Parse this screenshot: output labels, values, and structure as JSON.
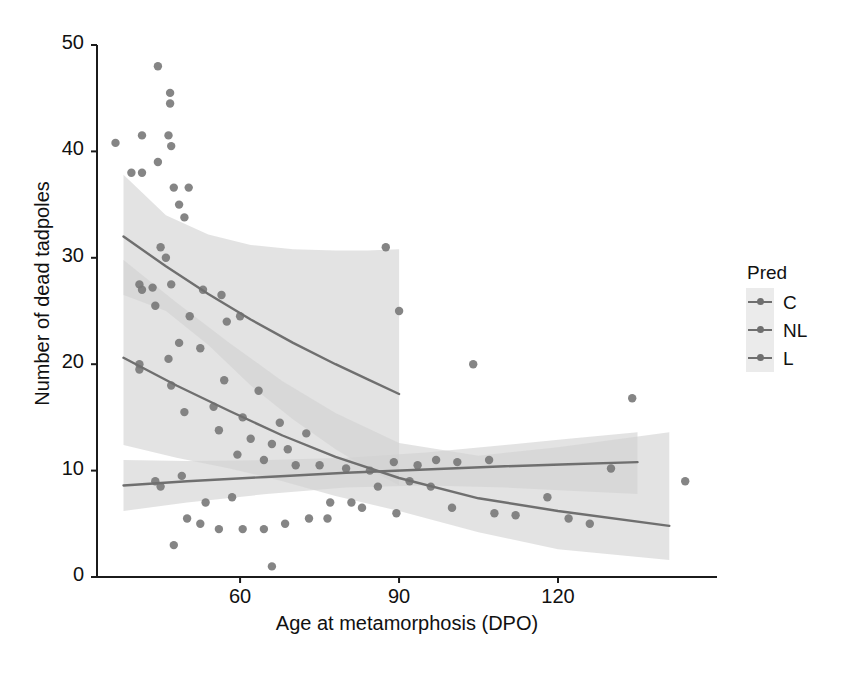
{
  "chart_data": {
    "type": "scatter",
    "title": "",
    "xlabel": "Age at metamorphosis (DPO)",
    "ylabel": "Number of dead tadpoles",
    "xlim": [
      33,
      150
    ],
    "ylim": [
      0,
      50
    ],
    "xticks": [
      60,
      90,
      120
    ],
    "yticks": [
      0,
      10,
      20,
      30,
      40,
      50
    ],
    "grid": false,
    "legend": {
      "title": "Pred",
      "position": "right",
      "entries": [
        "C",
        "NL",
        "L"
      ]
    },
    "point_color": "#787878",
    "line_color": "#6f6f6f",
    "band_color": "#d2d2d2",
    "points": [
      [
        36.5,
        40.8
      ],
      [
        44.5,
        48.0
      ],
      [
        46.8,
        45.5
      ],
      [
        46.8,
        44.5
      ],
      [
        41.5,
        41.5
      ],
      [
        46.5,
        41.5
      ],
      [
        47.0,
        40.5
      ],
      [
        44.5,
        39.0
      ],
      [
        41.5,
        38.0
      ],
      [
        47.5,
        36.6
      ],
      [
        50.3,
        36.6
      ],
      [
        48.5,
        35.0
      ],
      [
        49.5,
        33.8
      ],
      [
        39.5,
        38.0
      ],
      [
        45.0,
        31.0
      ],
      [
        46.0,
        30.0
      ],
      [
        87.5,
        31.0
      ],
      [
        41.0,
        27.5
      ],
      [
        41.5,
        27.0
      ],
      [
        43.5,
        27.2
      ],
      [
        47.0,
        27.5
      ],
      [
        53.0,
        27.0
      ],
      [
        56.5,
        26.5
      ],
      [
        44.0,
        25.5
      ],
      [
        50.5,
        24.5
      ],
      [
        57.5,
        24.0
      ],
      [
        60.0,
        24.5
      ],
      [
        48.5,
        22.0
      ],
      [
        52.5,
        21.5
      ],
      [
        46.5,
        20.5
      ],
      [
        41.0,
        20.0
      ],
      [
        41.0,
        19.5
      ],
      [
        47.0,
        18.0
      ],
      [
        57.0,
        18.5
      ],
      [
        63.5,
        17.5
      ],
      [
        55.0,
        16.0
      ],
      [
        49.5,
        15.5
      ],
      [
        60.5,
        15.0
      ],
      [
        67.5,
        14.5
      ],
      [
        72.5,
        13.5
      ],
      [
        56.0,
        13.8
      ],
      [
        62.0,
        13.0
      ],
      [
        66.0,
        12.5
      ],
      [
        69.0,
        12.0
      ],
      [
        59.5,
        11.5
      ],
      [
        64.5,
        11.0
      ],
      [
        70.5,
        10.5
      ],
      [
        75.0,
        10.5
      ],
      [
        80.0,
        10.2
      ],
      [
        84.5,
        10.0
      ],
      [
        89.0,
        10.8
      ],
      [
        93.5,
        10.5
      ],
      [
        97.0,
        11.0
      ],
      [
        101.0,
        10.8
      ],
      [
        104.0,
        20.0
      ],
      [
        90.0,
        25.0
      ],
      [
        134.0,
        16.8
      ],
      [
        144.0,
        9.0
      ],
      [
        130.0,
        10.2
      ],
      [
        118.0,
        7.5
      ],
      [
        122.0,
        5.5
      ],
      [
        126.0,
        5.0
      ],
      [
        112.0,
        5.8
      ],
      [
        108.0,
        6.0
      ],
      [
        100.0,
        6.5
      ],
      [
        96.0,
        8.5
      ],
      [
        92.0,
        9.0
      ],
      [
        86.0,
        8.5
      ],
      [
        81.0,
        7.0
      ],
      [
        77.0,
        7.0
      ],
      [
        73.0,
        5.5
      ],
      [
        68.5,
        5.0
      ],
      [
        64.5,
        4.5
      ],
      [
        60.5,
        4.5
      ],
      [
        56.0,
        4.5
      ],
      [
        52.5,
        5.0
      ],
      [
        50.0,
        5.5
      ],
      [
        53.5,
        7.0
      ],
      [
        58.5,
        7.5
      ],
      [
        66.0,
        1.0
      ],
      [
        47.5,
        3.0
      ],
      [
        45.0,
        8.5
      ],
      [
        49.0,
        9.5
      ],
      [
        44.0,
        9.0
      ],
      [
        76.5,
        5.5
      ],
      [
        83.0,
        6.5
      ],
      [
        89.5,
        6.0
      ],
      [
        107.0,
        11.0
      ]
    ],
    "series": [
      {
        "name": "C",
        "type": "fit-curve",
        "x_range": [
          38,
          90
        ],
        "fit": [
          [
            38,
            32.0
          ],
          [
            46,
            29.2
          ],
          [
            54,
            26.6
          ],
          [
            62,
            24.2
          ],
          [
            70,
            22.0
          ],
          [
            78,
            20.0
          ],
          [
            84,
            18.6
          ],
          [
            90,
            17.2
          ]
        ],
        "ci_upper": [
          [
            38,
            37.8
          ],
          [
            46,
            34.0
          ],
          [
            54,
            32.2
          ],
          [
            62,
            31.2
          ],
          [
            70,
            30.8
          ],
          [
            78,
            30.7
          ],
          [
            84,
            30.7
          ],
          [
            90,
            30.8
          ]
        ],
        "ci_lower": [
          [
            38,
            26.5
          ],
          [
            46,
            25.0
          ],
          [
            54,
            21.8
          ],
          [
            62,
            18.0
          ],
          [
            70,
            14.8
          ],
          [
            78,
            12.0
          ],
          [
            84,
            10.2
          ],
          [
            90,
            8.6
          ]
        ]
      },
      {
        "name": "NL",
        "type": "fit-curve",
        "x_range": [
          38,
          135
        ],
        "fit": [
          [
            38,
            8.6
          ],
          [
            50,
            9.0
          ],
          [
            65,
            9.4
          ],
          [
            80,
            9.8
          ],
          [
            95,
            10.1
          ],
          [
            110,
            10.4
          ],
          [
            122,
            10.6
          ],
          [
            135,
            10.8
          ]
        ],
        "ci_upper": [
          [
            38,
            11.0
          ],
          [
            50,
            10.9
          ],
          [
            65,
            11.0
          ],
          [
            80,
            11.2
          ],
          [
            95,
            11.7
          ],
          [
            110,
            12.4
          ],
          [
            122,
            13.0
          ],
          [
            135,
            13.6
          ]
        ],
        "ci_lower": [
          [
            38,
            6.2
          ],
          [
            50,
            7.0
          ],
          [
            65,
            7.8
          ],
          [
            80,
            8.4
          ],
          [
            95,
            8.6
          ],
          [
            110,
            8.4
          ],
          [
            122,
            8.1
          ],
          [
            135,
            7.8
          ]
        ]
      },
      {
        "name": "L",
        "type": "fit-curve",
        "x_range": [
          38,
          141
        ],
        "fit": [
          [
            38,
            20.6
          ],
          [
            48,
            18.0
          ],
          [
            58,
            15.6
          ],
          [
            68,
            13.3
          ],
          [
            78,
            11.3
          ],
          [
            90,
            9.3
          ],
          [
            105,
            7.4
          ],
          [
            120,
            6.2
          ],
          [
            141,
            4.8
          ]
        ],
        "ci_upper": [
          [
            38,
            29.8
          ],
          [
            48,
            25.8
          ],
          [
            58,
            22.0
          ],
          [
            68,
            18.4
          ],
          [
            78,
            15.4
          ],
          [
            90,
            12.6
          ],
          [
            105,
            11.4
          ],
          [
            120,
            12.2
          ],
          [
            141,
            13.6
          ]
        ],
        "ci_lower": [
          [
            38,
            12.4
          ],
          [
            48,
            11.2
          ],
          [
            58,
            10.2
          ],
          [
            68,
            9.0
          ],
          [
            78,
            7.6
          ],
          [
            90,
            6.2
          ],
          [
            105,
            4.2
          ],
          [
            120,
            2.6
          ],
          [
            141,
            1.6
          ]
        ]
      }
    ]
  }
}
